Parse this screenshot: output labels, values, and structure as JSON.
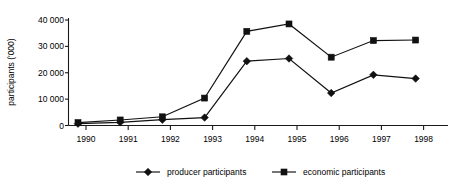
{
  "chart_data": {
    "type": "line",
    "title": "",
    "xlabel": "",
    "ylabel": "participants ('000)",
    "categories": [
      "1990",
      "1991",
      "1992",
      "1993",
      "1994",
      "1995",
      "1996",
      "1997",
      "1998"
    ],
    "xtick_labels": [
      "1990",
      "1991",
      "1992",
      "1993",
      "1994",
      "1995",
      "1996",
      "1997",
      "1998"
    ],
    "ytick_labels": [
      "0",
      "10 000",
      "20 000",
      "30 000",
      "40 000"
    ],
    "ytick_values": [
      0,
      10000,
      20000,
      30000,
      40000
    ],
    "ylim": [
      0,
      40000
    ],
    "grid": false,
    "legend_position": "bottom",
    "series": [
      {
        "name": "producer participants",
        "marker": "diamond",
        "color": "#111111",
        "values": [
          700,
          1200,
          2200,
          3000,
          24400,
          25400,
          12300,
          19200,
          17800
        ]
      },
      {
        "name": "economic participants",
        "marker": "square",
        "color": "#111111",
        "values": [
          1100,
          2100,
          3300,
          10400,
          35700,
          38500,
          25900,
          32200,
          32400
        ]
      }
    ]
  },
  "legend": {
    "items": [
      {
        "label": "producer participants",
        "marker": "diamond"
      },
      {
        "label": "economic participants",
        "marker": "square"
      }
    ]
  },
  "axes": {
    "y_title": "participants ('000)"
  }
}
